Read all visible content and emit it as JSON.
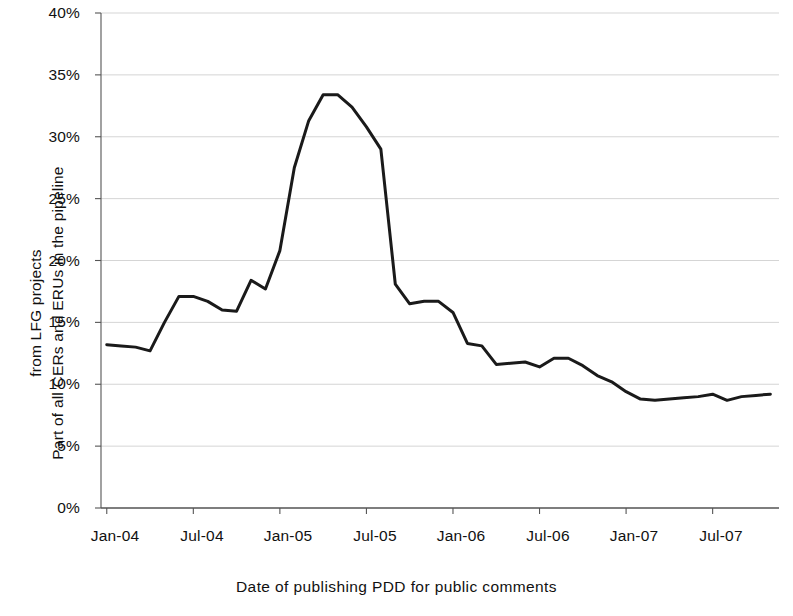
{
  "chart_data": {
    "type": "line",
    "title": "",
    "xlabel": "Date of publishing PDD for public comments",
    "ylabel_line1": "Part of all CERs and ERUs in the pipeline",
    "ylabel_line2": "from LFG projects",
    "ylim": [
      0,
      40
    ],
    "ytick_labels": [
      "0%",
      "5%",
      "10%",
      "15%",
      "20%",
      "25%",
      "30%",
      "35%",
      "40%"
    ],
    "ytick_values": [
      0,
      5,
      10,
      15,
      20,
      25,
      30,
      35,
      40
    ],
    "xtick_labels": [
      "Jan-04",
      "Jul-04",
      "Jan-05",
      "Jul-05",
      "Jan-06",
      "Jul-06",
      "Jan-07",
      "Jul-07"
    ],
    "xtick_months": [
      0,
      6,
      12,
      18,
      24,
      30,
      36,
      42
    ],
    "xlim_months": [
      -0.4,
      46.6
    ],
    "grid": "horizontal",
    "legend": "none",
    "line_color": "#1a1a1a",
    "line_width_px": 3.0,
    "units": "percent",
    "x": [
      0,
      1,
      2,
      3,
      4,
      5,
      6,
      7,
      8,
      9,
      10,
      11,
      12,
      13,
      14,
      15,
      16,
      17,
      18,
      19,
      20,
      21,
      22,
      23,
      24,
      25,
      26,
      27,
      28,
      29,
      30,
      31,
      32,
      33,
      34,
      35,
      36,
      37,
      38,
      39,
      40,
      41,
      42,
      43,
      44,
      45,
      46
    ],
    "x_labels": [
      "Jan-04",
      "Feb-04",
      "Mar-04",
      "Apr-04",
      "May-04",
      "Jun-04",
      "Jul-04",
      "Aug-04",
      "Sep-04",
      "Oct-04",
      "Nov-04",
      "Dec-04",
      "Jan-05",
      "Feb-05",
      "Mar-05",
      "Apr-05",
      "May-05",
      "Jun-05",
      "Jul-05",
      "Aug-05",
      "Sep-05",
      "Oct-05",
      "Nov-05",
      "Dec-05",
      "Jan-06",
      "Feb-06",
      "Mar-06",
      "Apr-06",
      "May-06",
      "Jun-06",
      "Jul-06",
      "Aug-06",
      "Sep-06",
      "Oct-06",
      "Nov-06",
      "Dec-06",
      "Jan-07",
      "Feb-07",
      "Mar-07",
      "Apr-07",
      "May-07",
      "Jun-07",
      "Jul-07",
      "Aug-07",
      "Sep-07",
      "Oct-07",
      "Nov-07"
    ],
    "values": [
      13.2,
      13.1,
      13.0,
      12.7,
      15.0,
      17.1,
      17.1,
      16.7,
      16.0,
      15.9,
      18.4,
      17.7,
      20.8,
      27.5,
      31.3,
      33.4,
      33.4,
      32.4,
      30.8,
      29.0,
      18.1,
      16.5,
      16.7,
      16.7,
      15.8,
      13.3,
      13.1,
      11.6,
      11.7,
      11.8,
      11.4,
      12.1,
      12.1,
      11.5,
      10.7,
      10.2,
      9.4,
      8.8,
      8.7,
      8.8,
      8.9,
      9.0,
      9.2,
      8.7,
      9.0,
      9.1,
      9.2
    ],
    "series_name": "Part of all CERs and ERUs in the pipeline from LFG projects",
    "peak": {
      "label": "Apr-05 / May-05",
      "value": 33.4
    },
    "minimum": {
      "label": "Mar-07",
      "value": 8.7
    }
  },
  "axes_geometry": {
    "plot_left_px": 101,
    "plot_right_px": 779,
    "plot_top_px": 13,
    "plot_bottom_px": 508
  }
}
